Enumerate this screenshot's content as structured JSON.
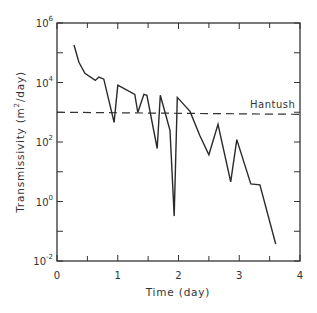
{
  "chart_data": {
    "type": "line",
    "title": "",
    "xlabel": "Time (day)",
    "ylabel": "Transmissivity (m²/day)",
    "xlim": [
      0,
      4
    ],
    "ylim_log10": [
      -2,
      6
    ],
    "yscale": "log",
    "grid": false,
    "x_ticks": [
      {
        "value": 0,
        "label": "0"
      },
      {
        "value": 1,
        "label": "1"
      },
      {
        "value": 2,
        "label": "2"
      },
      {
        "value": 3,
        "label": "3"
      },
      {
        "value": 4,
        "label": "4"
      }
    ],
    "x_minor_ticks": [
      0.5,
      1.5,
      2.5,
      3.5
    ],
    "y_ticks": [
      {
        "log10": -2,
        "base": "10",
        "exp": "-2"
      },
      {
        "log10": 0,
        "base": "10",
        "exp": "0"
      },
      {
        "log10": 2,
        "base": "10",
        "exp": "2"
      },
      {
        "log10": 4,
        "base": "10",
        "exp": "4"
      },
      {
        "log10": 6,
        "base": "10",
        "exp": "6"
      }
    ],
    "y_minor_ticks_log10": [
      -1,
      1,
      3,
      5
    ],
    "series": [
      {
        "name": "Transmissivity",
        "style": "solid",
        "x": [
          0.28,
          0.36,
          0.46,
          0.63,
          0.69,
          0.77,
          0.94,
          1.0,
          1.28,
          1.33,
          1.43,
          1.48,
          1.65,
          1.7,
          1.86,
          1.93,
          1.98,
          2.19,
          2.35,
          2.5,
          2.65,
          2.86,
          2.96,
          3.19,
          3.34,
          3.6
        ],
        "log10_y": [
          5.26,
          4.68,
          4.31,
          4.07,
          4.18,
          4.11,
          2.66,
          3.91,
          3.6,
          2.99,
          3.6,
          3.57,
          1.78,
          3.57,
          2.39,
          -0.49,
          3.5,
          3.03,
          2.22,
          1.57,
          2.59,
          0.66,
          2.08,
          0.59,
          0.56,
          -1.43
        ]
      }
    ],
    "reference_lines": [
      {
        "name": "Hantush",
        "label": "Hantush",
        "style": "dashed",
        "x": [
          0,
          4
        ],
        "log10_y": [
          3.0,
          2.93
        ]
      }
    ]
  }
}
